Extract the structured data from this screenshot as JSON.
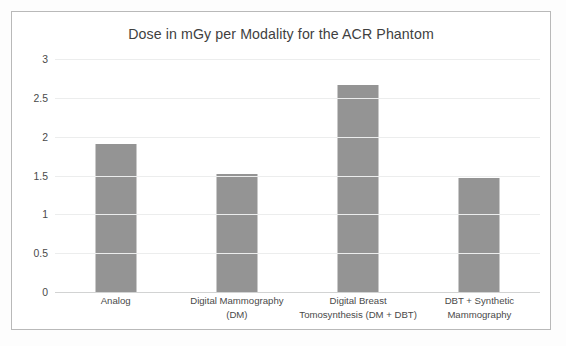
{
  "chart_data": {
    "type": "bar",
    "title": "Dose in mGy per Modality for the ACR Phantom",
    "xlabel": "",
    "ylabel": "",
    "categories": [
      "Analog",
      "Digital Mammography (DM)",
      "Digital Breast Tomosynthesis (DM + DBT)",
      "DBT + Synthetic Mammography"
    ],
    "category_lines": [
      [
        "Analog"
      ],
      [
        "Digital Mammography",
        "(DM)"
      ],
      [
        "Digital Breast",
        "Tomosynthesis (DM + DBT)"
      ],
      [
        "DBT + Synthetic",
        "Mammography"
      ]
    ],
    "values": [
      1.9,
      1.52,
      2.67,
      1.47
    ],
    "ylim": [
      0,
      3
    ],
    "ytick_labels": [
      "3",
      "2.5",
      "2",
      "1.5",
      "1",
      "0.5",
      "0"
    ],
    "ytick_values": [
      3,
      2.5,
      2,
      1.5,
      1,
      0.5,
      0
    ],
    "grid": true,
    "legend": false,
    "legend_position": "none",
    "bar_color": "#949494",
    "gridline_color": "#eceded",
    "axis_color": "#d2d3d3",
    "text_color": "#4a4a4a",
    "title_color": "#3f3f3f",
    "frame_color": "#b9b9b9",
    "background_color": "#ffffff"
  }
}
